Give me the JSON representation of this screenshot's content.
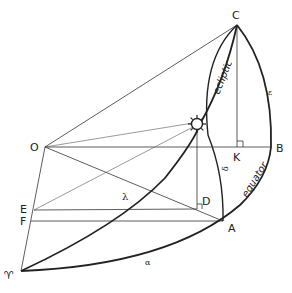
{
  "figure": {
    "points": {
      "C": "C",
      "O": "O",
      "B": "B",
      "K": "K",
      "D": "D",
      "A": "A",
      "E": "E",
      "F": "F",
      "vernal_equinox": "♈"
    },
    "curves": {
      "ecliptic": "ecliptic",
      "equator": "equator"
    },
    "angles": {
      "lambda": "λ",
      "delta": "δ",
      "alpha": "α",
      "epsilon": "ε"
    },
    "icons": {
      "sun": "sun-icon",
      "right_angle_K": "right-angle-marker",
      "right_angle_D": "right-angle-marker"
    },
    "colors": {
      "line": "#222222",
      "background": "#ffffff"
    }
  }
}
